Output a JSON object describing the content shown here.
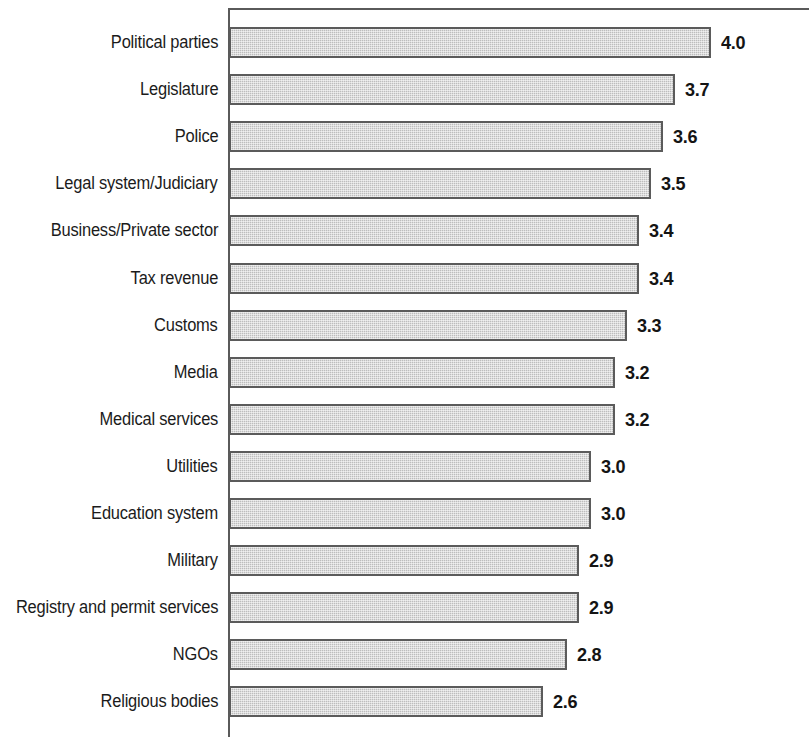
{
  "chart_data": {
    "type": "bar",
    "orientation": "horizontal",
    "title": "",
    "subtitle": "",
    "xlabel": "",
    "ylabel": "",
    "xlim": [
      0,
      4.8
    ],
    "grid": false,
    "legend": null,
    "value_labels_shown": true,
    "categories": [
      "Political parties",
      "Legislature",
      "Police",
      "Legal system/Judiciary",
      "Business/Private sector",
      "Tax revenue",
      "Customs",
      "Media",
      "Medical services",
      "Utilities",
      "Education system",
      "Military",
      "Registry and permit services",
      "NGOs",
      "Religious bodies"
    ],
    "values": [
      4.0,
      3.7,
      3.6,
      3.5,
      3.4,
      3.4,
      3.3,
      3.2,
      3.2,
      3.0,
      3.0,
      2.9,
      2.9,
      2.8,
      2.6
    ],
    "value_labels": [
      "4.0",
      "3.7",
      "3.6",
      "3.5",
      "3.4",
      "3.4",
      "3.3",
      "3.2",
      "3.2",
      "3.0",
      "3.0",
      "2.9",
      "2.9",
      "2.8",
      "2.6"
    ],
    "series": [
      {
        "name": "",
        "values": [
          4.0,
          3.7,
          3.6,
          3.5,
          3.4,
          3.4,
          3.3,
          3.2,
          3.2,
          3.0,
          3.0,
          2.9,
          2.9,
          2.8,
          2.6
        ]
      }
    ],
    "colors": {
      "bar_fill": "#c9c9c9",
      "bar_border": "#5b5b5b",
      "axis": "#5a5a5a",
      "text": "#1b1b1b",
      "background": "#ffffff"
    }
  }
}
